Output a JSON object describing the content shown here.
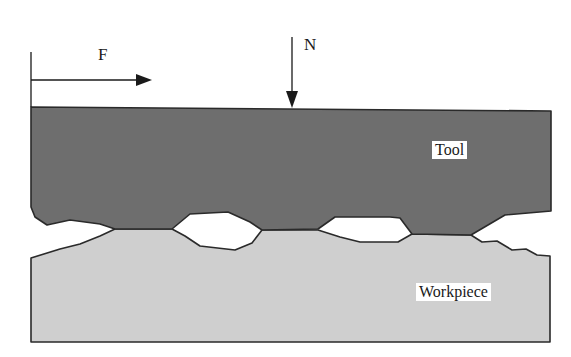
{
  "diagram": {
    "type": "tribology-contact-schematic",
    "forces": {
      "friction": {
        "label": "F",
        "direction": "right"
      },
      "normal": {
        "label": "N",
        "direction": "down"
      }
    },
    "bodies": {
      "tool": {
        "label": "Tool",
        "fill": "#6e6e6e"
      },
      "workpiece": {
        "label": "Workpiece",
        "fill": "#cfcfcf"
      }
    },
    "colors": {
      "outline": "#2a2a2a",
      "arrow": "#1a1a1a",
      "gap": "#ffffff"
    }
  }
}
